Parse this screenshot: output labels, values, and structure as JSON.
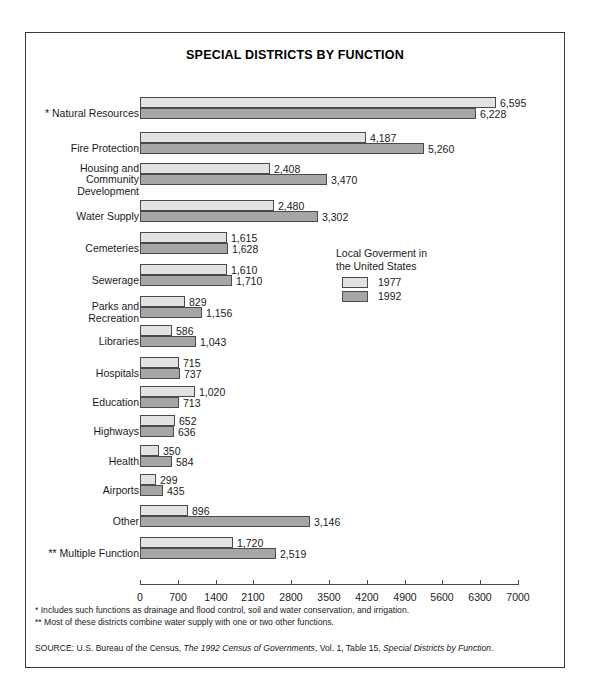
{
  "figure": {
    "title": "SPECIAL DISTRICTS BY FUNCTION"
  },
  "legend": {
    "title": "Local Goverment in\nthe United States",
    "items": [
      {
        "label": "1977",
        "color": "#e2e2e2"
      },
      {
        "label": "1992",
        "color": "#a6a6a6"
      }
    ]
  },
  "axis": {
    "ticks": [
      "0",
      "700",
      "1400",
      "2100",
      "2800",
      "3500",
      "4200",
      "4900",
      "5600",
      "6300",
      "7000"
    ],
    "min": 0,
    "max": 7000,
    "step": 700
  },
  "notes": {
    "footnote_1": "*  Includes such functions as drainage and flood control, soil and water conservation, and irrigation.",
    "footnote_2": "** Most of these districts combine water supply with one or two other functions.",
    "source_prefix": "SOURCE:  U.S. Bureau of the Census, ",
    "source_italic_1": "The 1992 Census of Governments",
    "source_middle": ", Vol. 1, Table 15, ",
    "source_italic_2": "Special Districts by Function",
    "source_suffix": "."
  },
  "chart_data": {
    "type": "bar",
    "orientation": "horizontal",
    "title": "SPECIAL DISTRICTS BY FUNCTION",
    "xlabel": "",
    "ylabel": "",
    "xlim": [
      0,
      7000
    ],
    "grid": false,
    "legend_position": "middle-right",
    "categories": [
      "* Natural Resources",
      "Fire Protection",
      "Housing and\nCommunity\nDevelopment",
      "Water Supply",
      "Cemeteries",
      "Sewerage",
      "Parks and\nRecreation",
      "Libraries",
      "Hospitals",
      "Education",
      "Highways",
      "Health",
      "Airports",
      "Other",
      "** Multiple Function"
    ],
    "series": [
      {
        "name": "1977",
        "color": "#e2e2e2",
        "values": [
          6595,
          4187,
          2408,
          2480,
          1615,
          1610,
          829,
          586,
          715,
          1020,
          652,
          350,
          299,
          896,
          1720
        ],
        "labels": [
          "6,595",
          "4,187",
          "2,408",
          "2,480",
          "1,615",
          "1,610",
          "829",
          "586",
          "715",
          "1,020",
          "652",
          "350",
          "299",
          "896",
          "1,720"
        ]
      },
      {
        "name": "1992",
        "color": "#a6a6a6",
        "values": [
          6228,
          5260,
          3470,
          3302,
          1628,
          1710,
          1156,
          1043,
          737,
          713,
          636,
          584,
          435,
          3146,
          2519
        ],
        "labels": [
          "6,228",
          "5,260",
          "3,470",
          "3,302",
          "1,628",
          "1,710",
          "1,156",
          "1,043",
          "737",
          "713",
          "636",
          "584",
          "435",
          "3,146",
          "2,519"
        ]
      }
    ]
  }
}
